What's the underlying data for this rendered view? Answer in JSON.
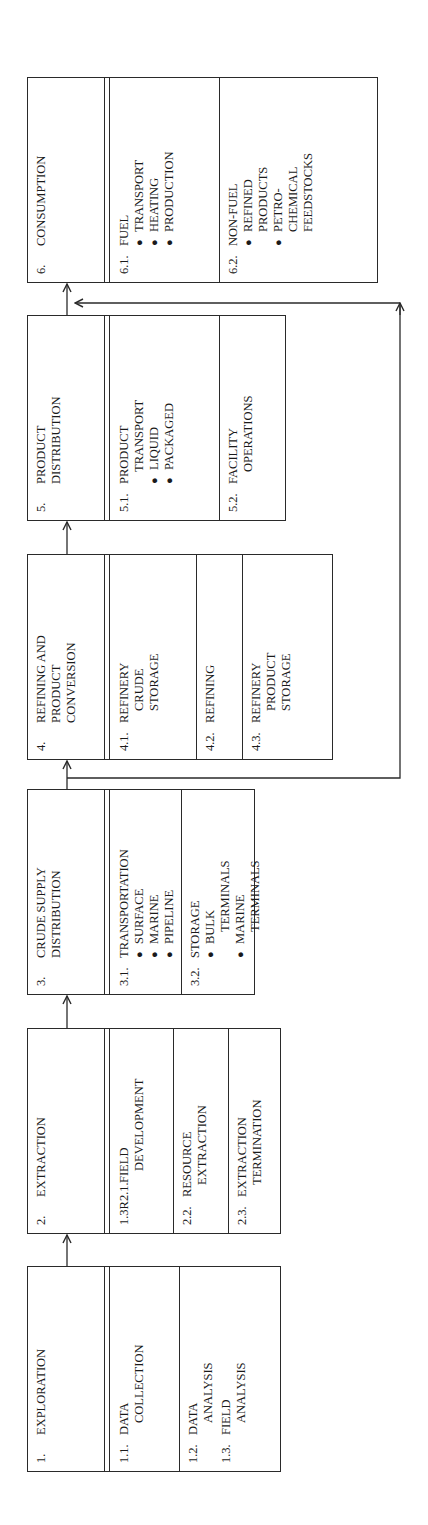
{
  "diagram": {
    "stages": [
      {
        "num": "1.",
        "title_lines": [
          "EXPLORATION"
        ],
        "subs": [
          {
            "num": "1.1.",
            "lines": [
              "DATA",
              "COLLECTION"
            ]
          },
          {
            "num": "1.2.",
            "lines": [
              "DATA",
              "ANALYSIS"
            ]
          },
          {
            "num": "1.3.",
            "lines": [
              "FIELD",
              "ANALYSIS"
            ]
          }
        ]
      },
      {
        "num": "2.",
        "title_lines": [
          "EXTRACTION"
        ],
        "subs": [
          {
            "num": "1.3R2.1.",
            "lines": [
              "FIELD",
              "DEVELOPMENT"
            ]
          },
          {
            "num": "2.2.",
            "lines": [
              "RESOURCE",
              "EXTRACTION"
            ]
          },
          {
            "num": "2.3.",
            "lines": [
              "EXTRACTION",
              "TERMINATION"
            ]
          }
        ]
      },
      {
        "num": "3.",
        "title_lines": [
          "CRUDE SUPPLY",
          "DISTRIBUTION"
        ],
        "subs": [
          {
            "num": "3.1.",
            "lines": [
              "TRANSPORTATION"
            ],
            "bullets": [
              [
                "SURFACE"
              ],
              [
                "MARINE"
              ],
              [
                "PIPELINE"
              ]
            ]
          },
          {
            "num": "3.2.",
            "lines": [
              "STORAGE"
            ],
            "bullets": [
              [
                "BULK",
                "TERMINALS"
              ],
              [
                "MARINE",
                "TERMINALS"
              ]
            ]
          }
        ]
      },
      {
        "num": "4.",
        "title_lines": [
          "REFINING AND",
          "PRODUCT",
          "CONVERSION"
        ],
        "subs": [
          {
            "num": "4.1.",
            "lines": [
              "REFINERY",
              "CRUDE",
              "STORAGE"
            ]
          },
          {
            "num": "4.2.",
            "lines": [
              "REFINING"
            ]
          },
          {
            "num": "4.3.",
            "lines": [
              "REFINERY",
              "PRODUCT",
              "STORAGE"
            ]
          }
        ]
      },
      {
        "num": "5.",
        "title_lines": [
          "PRODUCT",
          "DISTRIBUTION"
        ],
        "subs": [
          {
            "num": "5.1.",
            "lines": [
              "PRODUCT",
              "TRANSPORT"
            ],
            "bullets": [
              [
                "LIQUID"
              ],
              [
                "PACKAGED"
              ]
            ]
          },
          {
            "num": "5.2.",
            "lines": [
              "FACILITY",
              "OPERATIONS"
            ]
          }
        ]
      },
      {
        "num": "6.",
        "title_lines": [
          "CONSUMPTION"
        ],
        "subs": [
          {
            "num": "6.1.",
            "lines": [
              "FUEL"
            ],
            "bullets": [
              [
                "TRANSPORT"
              ],
              [
                "HEATING"
              ],
              [
                "PRODUCTION"
              ]
            ]
          },
          {
            "num": "6.2.",
            "lines": [
              "NON-FUEL"
            ],
            "bullets": [
              [
                "REFINED",
                "PRODUCTS"
              ],
              [
                "PETRO-",
                "CHEMICAL",
                "FEEDSTOCKS"
              ]
            ]
          }
        ]
      }
    ],
    "bullet_glyph": "●",
    "line_color": "#2a2a2a"
  }
}
